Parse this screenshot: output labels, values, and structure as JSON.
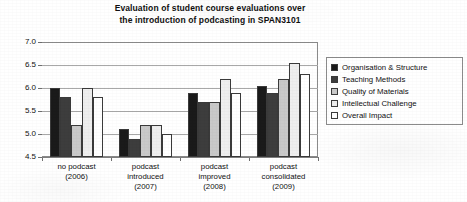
{
  "chart_data": {
    "type": "bar",
    "title": "Evaluation of student course evaluations over the introduction of podcasting in SPAN3101",
    "title_lines": [
      "Evaluation of student course evaluations over",
      "the introduction of podcasting in SPAN3101"
    ],
    "xlabel": "",
    "ylabel": "",
    "ylim": [
      4.5,
      7.0
    ],
    "ytick_step": 0.5,
    "ytick_labels": [
      "7.0",
      "6.5",
      "6.0",
      "5.5",
      "5.0",
      "4.5"
    ],
    "ytick_values": [
      7.0,
      6.5,
      6.0,
      5.5,
      5.0,
      4.5
    ],
    "grid": true,
    "legend_position": "right",
    "categories": [
      "no podcast (2006)",
      "podcast introduced (2007)",
      "podcast improved (2008)",
      "podcast consolidated (2009)"
    ],
    "category_lines": [
      [
        "no podcast",
        "(2006)"
      ],
      [
        "podcast",
        "introduced",
        "(2007)"
      ],
      [
        "podcast",
        "improved",
        "(2008)"
      ],
      [
        "podcast",
        "consolidated",
        "(2009)"
      ]
    ],
    "series": [
      {
        "name": "Organisation & Structure",
        "color": "#1a1a1a",
        "values": [
          6.0,
          5.1,
          5.9,
          6.05
        ]
      },
      {
        "name": "Teaching Methods",
        "color": "#3d3d3d",
        "values": [
          5.8,
          4.9,
          5.7,
          5.9
        ]
      },
      {
        "name": "Quality of Materials",
        "color": "#c9c9c9",
        "values": [
          5.2,
          5.2,
          5.7,
          6.2
        ]
      },
      {
        "name": "Intellectual Challenge",
        "color": "#eeeeee",
        "values": [
          6.0,
          5.2,
          6.2,
          6.55
        ]
      },
      {
        "name": "Overall Impact",
        "color": "#ffffff",
        "values": [
          5.8,
          5.0,
          5.9,
          6.3
        ]
      }
    ]
  },
  "colors": {
    "grid": "#a8a8a8",
    "axis": "#6f6f6f",
    "frame": "#8b8b8b",
    "bar_outline": "#3a3a3a",
    "text": "#111111",
    "background": "#ffffff"
  }
}
